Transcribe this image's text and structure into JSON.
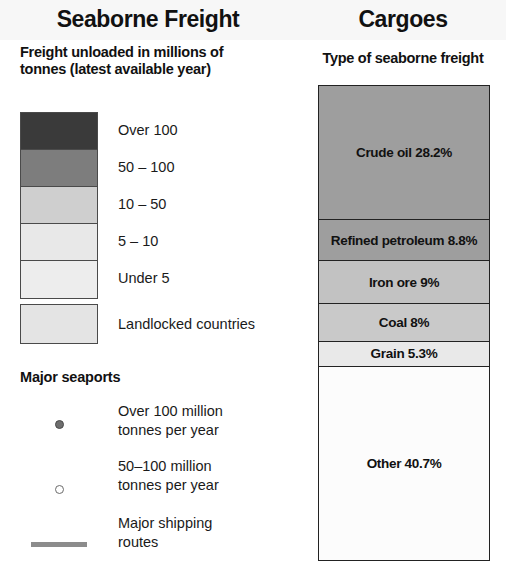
{
  "header": {
    "left_title": "Seaborne Freight",
    "right_title": "Cargoes"
  },
  "left_panel": {
    "subhead": "Freight unloaded in millions of tonnes (latest available year)",
    "choropleth_legend": [
      {
        "label": "Over 100",
        "color": "#3a3a3a"
      },
      {
        "label": "50 – 100",
        "color": "#7d7d7d"
      },
      {
        "label": "10 – 50",
        "color": "#cfcfcf"
      },
      {
        "label": "5 – 10",
        "color": "#e8e8e8"
      },
      {
        "label": "Under 5",
        "color": "#ededed"
      }
    ],
    "landlocked": {
      "label": "Landlocked countries",
      "color": "#e4e4e4"
    },
    "seaports": {
      "heading": "Major seaports",
      "items": [
        {
          "marker": "filled-dot",
          "line1": "Over 100 million",
          "line2": "tonnes per year"
        },
        {
          "marker": "hollow-dot",
          "line1": "50–100 million",
          "line2": "tonnes per year"
        },
        {
          "marker": "thick-line",
          "line1": "Major shipping",
          "line2": "routes"
        }
      ]
    }
  },
  "right_panel": {
    "subhead": "Type of seaborne freight"
  },
  "chart_data": {
    "type": "bar",
    "title": "Type of seaborne freight",
    "xlabel": "",
    "ylabel": "Share of seaborne freight (%)",
    "categories": [
      "Crude oil",
      "Refined petroleum",
      "Iron ore",
      "Coal",
      "Grain",
      "Other"
    ],
    "values": [
      28.2,
      8.8,
      9.0,
      8.0,
      5.3,
      40.7
    ],
    "labels": [
      "Crude oil 28.2%",
      "Refined petroleum 8.8%",
      "Iron ore 9%",
      "Coal 8%",
      "Grain 5.3%",
      "Other 40.7%"
    ],
    "colors": [
      "#9e9e9e",
      "#9e9e9e",
      "#c2c2c2",
      "#c9c9c9",
      "#e9e9e9",
      "#fcfcfc"
    ],
    "ylim": [
      0,
      100
    ],
    "grid": false,
    "legend": "none",
    "orientation": "stacked-vertical"
  },
  "colors": {
    "ink": "#111111",
    "rule": "#222222",
    "band_bg": "#f7f7f7"
  }
}
